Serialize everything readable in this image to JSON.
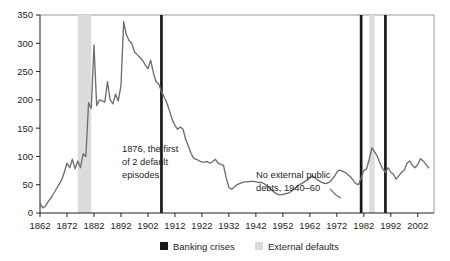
{
  "chart_data": {
    "type": "line",
    "title": "",
    "subtitle": "",
    "xlabel": "",
    "ylabel": "",
    "xlim": [
      1862,
      2008
    ],
    "ylim": [
      0,
      350
    ],
    "yticks": [
      0,
      50,
      100,
      150,
      200,
      250,
      300,
      350
    ],
    "xticks": [
      1862,
      1872,
      1882,
      1892,
      1902,
      1912,
      1922,
      1932,
      1942,
      1952,
      1962,
      1972,
      1982,
      1992,
      2002
    ],
    "grid": false,
    "legend_position": "bottom-center",
    "series": [
      {
        "name": "Total external debt (percent of exports)",
        "color": "#6d6e70",
        "x": [
          1862,
          1863,
          1864,
          1865,
          1866,
          1867,
          1868,
          1869,
          1870,
          1871,
          1872,
          1873,
          1874,
          1875,
          1876,
          1877,
          1878,
          1879,
          1880,
          1881,
          1882,
          1883,
          1884,
          1885,
          1886,
          1887,
          1888,
          1889,
          1890,
          1891,
          1892,
          1893,
          1894,
          1895,
          1896,
          1897,
          1898,
          1899,
          1900,
          1901,
          1902,
          1903,
          1904,
          1905,
          1906,
          1907,
          1908,
          1909,
          1910,
          1911,
          1912,
          1913,
          1914,
          1915,
          1916,
          1917,
          1918,
          1919,
          1920,
          1921,
          1922,
          1923,
          1924,
          1925,
          1926,
          1927,
          1928,
          1929,
          1930,
          1931,
          1932,
          1933,
          1934,
          1935,
          1936,
          1937,
          1938,
          1939,
          1940,
          1941,
          1942,
          1943,
          1944,
          1945,
          1946,
          1947,
          1948,
          1949,
          1950,
          1951,
          1952,
          1953,
          1954,
          1955,
          1956,
          1957,
          1958,
          1959,
          1960,
          1961,
          1962,
          1963,
          1964,
          1965,
          1966,
          1967,
          1968,
          1969,
          1970,
          1971,
          1972,
          1973,
          1974,
          1975,
          1976,
          1977,
          1978,
          1979,
          1980,
          1981,
          1982,
          1983,
          1984,
          1985,
          1986,
          1987,
          1988,
          1989,
          1990,
          1991,
          1992,
          1993,
          1994,
          1995,
          1996,
          1997,
          1998,
          1999,
          2000,
          2001,
          2002,
          2003,
          2004,
          2005,
          2006
        ],
        "values": [
          18,
          9,
          12,
          20,
          26,
          34,
          42,
          50,
          58,
          72,
          88,
          80,
          95,
          78,
          92,
          80,
          105,
          100,
          195,
          185,
          297,
          190,
          200,
          198,
          196,
          232,
          200,
          193,
          210,
          198,
          225,
          338,
          315,
          305,
          300,
          285,
          280,
          275,
          270,
          262,
          255,
          270,
          248,
          232,
          228,
          215,
          205,
          195,
          180,
          165,
          155,
          148,
          152,
          148,
          130,
          118,
          105,
          96,
          95,
          92,
          90,
          90,
          91,
          88,
          91,
          95,
          88,
          86,
          84,
          62,
          45,
          42,
          46,
          50,
          52,
          54,
          55,
          55,
          56,
          56,
          55,
          54,
          54,
          52,
          48,
          44,
          40,
          36,
          33,
          32,
          33,
          34,
          35,
          38,
          42,
          46,
          50,
          52,
          55,
          58,
          62,
          66,
          62,
          58,
          55,
          53,
          52,
          54,
          58,
          64,
          72,
          76,
          74,
          72,
          68,
          64,
          58,
          52,
          50,
          62,
          75,
          78,
          95,
          115,
          108,
          100,
          88,
          78,
          72,
          80,
          72,
          68,
          60,
          66,
          72,
          76,
          88,
          92,
          84,
          80,
          86,
          96,
          92,
          86,
          80
        ]
      }
    ],
    "events": {
      "banking_crises": [
        {
          "label": "Banking crisis",
          "start": 1907,
          "end": 1908
        },
        {
          "label": "Banking crisis",
          "start": 1981,
          "end": 1982
        },
        {
          "label": "Banking crisis",
          "start": 1990,
          "end": 1991
        }
      ],
      "external_defaults": [
        {
          "label": "External default",
          "start": 1876,
          "end": 1881
        },
        {
          "label": "External default",
          "start": 1984,
          "end": 1986
        }
      ]
    },
    "annotations": [
      {
        "name": "first-default-note",
        "text": [
          "1876, the first",
          "of 2 default",
          "episodes"
        ],
        "x": 1884,
        "y": 110
      },
      {
        "name": "no-external-debt-note",
        "text": [
          "No external public",
          "debts, 1940–60"
        ],
        "x": 1948,
        "y": 62
      }
    ]
  },
  "legend": {
    "items": [
      {
        "label": "Banking crises",
        "color": "#1a1a1a",
        "name": "legend-banking-crises"
      },
      {
        "label": "External defaults",
        "color": "#d9d9d9",
        "name": "legend-external-defaults"
      }
    ]
  },
  "axes": {
    "y_tick_labels": [
      "0",
      "50",
      "100",
      "150",
      "200",
      "250",
      "300",
      "350"
    ],
    "x_tick_labels": [
      "1862",
      "1872",
      "1882",
      "1892",
      "1902",
      "1912",
      "1922",
      "1932",
      "1942",
      "1952",
      "1962",
      "1972",
      "1982",
      "1992",
      "2002"
    ]
  },
  "annotation_text": {
    "note1_line1": "1876, the first",
    "note1_line2": "of 2 default",
    "note1_line3": "episodes",
    "note2_line1": "No external public",
    "note2_line2": "debts, 1940–60"
  }
}
